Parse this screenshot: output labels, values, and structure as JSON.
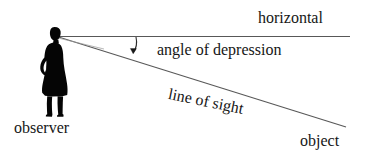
{
  "diagram": {
    "background_color": "#ffffff",
    "line_color": "#4a4a4a",
    "text_color": "#161616",
    "figure_color": "#000000",
    "labels": {
      "horizontal": "horizontal",
      "angle_of_depression": "angle of depression",
      "line_of_sight": "line of sight",
      "observer": "observer",
      "object": "object"
    },
    "geometry": {
      "vertex_x": 57,
      "vertex_y": 36,
      "horizontal_end_x": 350,
      "horizontal_end_y": 36,
      "sight_end_x": 346,
      "sight_end_y": 127,
      "angle_of_depression_degrees": 17,
      "line_of_sight_rotation_degrees": 11.5
    },
    "icons": {
      "observer": "person-silhouette-icon",
      "angle_marker": "angle-arc-arrow-icon"
    }
  }
}
